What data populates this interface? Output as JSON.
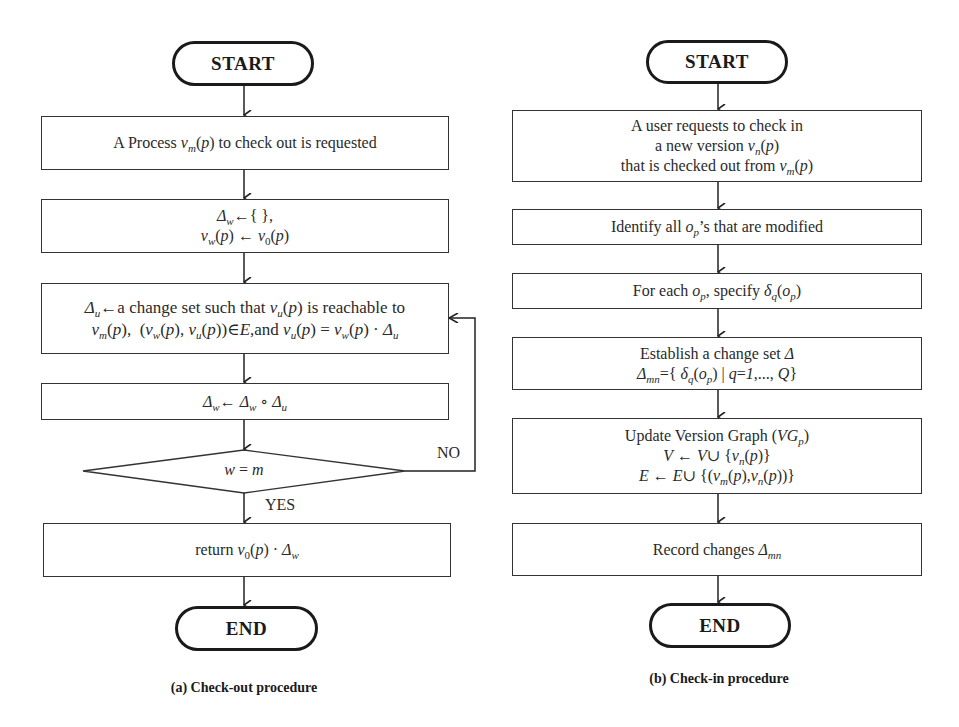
{
  "checkout": {
    "start_label": "START",
    "end_label": "END",
    "caption": "(a) Check-out procedure",
    "steps": [
      {
        "lines": [
          "A Process v_m(p) to check out is requested"
        ]
      },
      {
        "lines": [
          "Δ_w ← { },",
          "v_w(p) ← v_0(p)"
        ]
      },
      {
        "lines": [
          "Δ_u ← a change set such that v_u(p) is reachable to",
          "v_m(p), (v_w(p), v_u(p)) ∈ E, and v_u(p) = v_w(p) · Δ_u"
        ]
      },
      {
        "lines": [
          "Δ_w ← Δ_w ∘ Δ_u"
        ]
      },
      {
        "lines": [
          "return v_0(p) · Δ_w"
        ]
      }
    ],
    "decision": {
      "condition": "w = m",
      "yes_label": "YES",
      "no_label": "NO"
    }
  },
  "checkin": {
    "start_label": "START",
    "end_label": "END",
    "caption": "(b) Check-in procedure",
    "steps": [
      {
        "lines": [
          "A user requests to check in",
          "a new version v_n(p)",
          "that is checked out from v_m(p)"
        ]
      },
      {
        "lines": [
          "Identify all o_p's that are modified"
        ]
      },
      {
        "lines": [
          "For each o_p, specify δ_q(o_p)"
        ]
      },
      {
        "lines": [
          "Establish a change set Δ",
          "Δ_mn = { δ_q(o_p) | q = 1,..., Q }"
        ]
      },
      {
        "lines": [
          "Update Version Graph (VG_p)",
          "V ← V ∪ { v_n(p) }",
          "E ← E ∪ { (v_m(p), v_n(p)) }"
        ]
      },
      {
        "lines": [
          "Record changes Δ_mn"
        ]
      }
    ]
  },
  "colors": {
    "line": "#333333",
    "text": "#2a2a2a",
    "background": "#ffffff"
  }
}
